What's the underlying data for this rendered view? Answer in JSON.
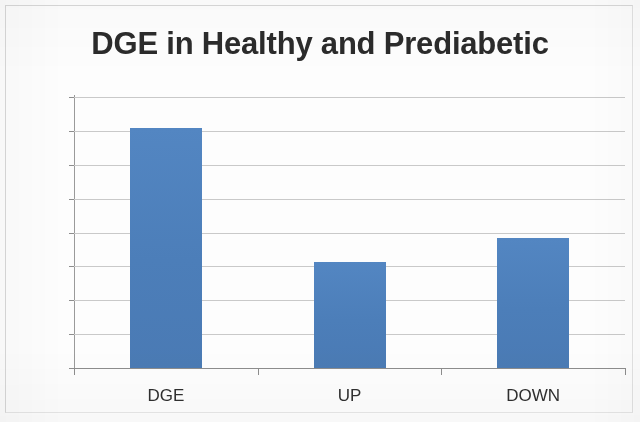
{
  "chart_data": {
    "type": "bar",
    "title": "DGE in Healthy and Prediabetic",
    "xlabel": "",
    "ylabel": "",
    "categories": [
      "DGE",
      "UP",
      "DOWN"
    ],
    "values": [
      3545,
      1570,
      1925
    ],
    "series": [
      {
        "name": "DGE in Healthy and Prediabetic",
        "values": [
          3545,
          1570,
          1925
        ]
      }
    ],
    "ylim": [
      0,
      4000
    ],
    "ytick_labels": [
      "4000",
      "3500",
      "3000",
      "2500",
      "2000",
      "1500",
      "1000",
      "500",
      "0"
    ],
    "ytick_values": [
      4000,
      3500,
      3000,
      2500,
      2000,
      1500,
      1000,
      500,
      0
    ],
    "ytick_step": 500,
    "grid": true,
    "grid_axis": "y",
    "legend": false,
    "legend_position": "none",
    "bar_color": "#4F81BD",
    "gridline_color": "#C9C9C9",
    "axis_color": "#8D8D8D",
    "title_color": "#2B2B2B",
    "background_color": "#FFFFFF"
  }
}
